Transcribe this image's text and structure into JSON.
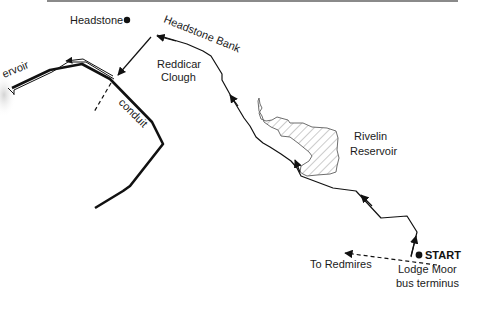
{
  "map": {
    "labels": {
      "headstone": "Headstone",
      "headstone_bank": "Headstone Bank",
      "reddicar_line1": "Reddicar",
      "reddicar_line2": "Clough",
      "reservoir_partial": "ervoir",
      "conduit": "conduit",
      "rivelin_line1": "Rivelin",
      "rivelin_line2": "Reservoir",
      "start": "START",
      "to_redmires": "To Redmires",
      "lodge_moor_line1": "Lodge Moor",
      "lodge_moor_line2": "bus terminus"
    },
    "colors": {
      "ink": "#111111",
      "top_rule": "#8a8a8a",
      "hatch": "#9a9a9a",
      "reservoir_edge": "#6e6e6e",
      "background": "#ffffff"
    }
  }
}
